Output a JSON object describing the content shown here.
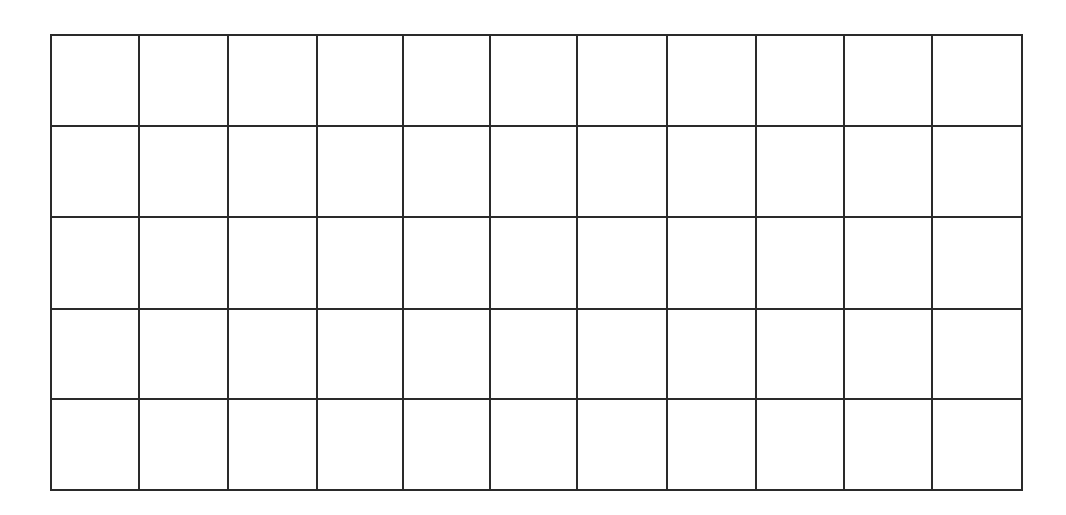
{
  "grid": {
    "rows": 5,
    "cols": 11,
    "line_color": "#2a2a2a",
    "background": "#ffffff",
    "x_lines": [
      51,
      139,
      228,
      317,
      403,
      490,
      577,
      667,
      756,
      844,
      932,
      1022
    ],
    "y_lines": [
      35,
      126,
      217,
      309,
      399,
      490
    ],
    "line_width": 2
  }
}
